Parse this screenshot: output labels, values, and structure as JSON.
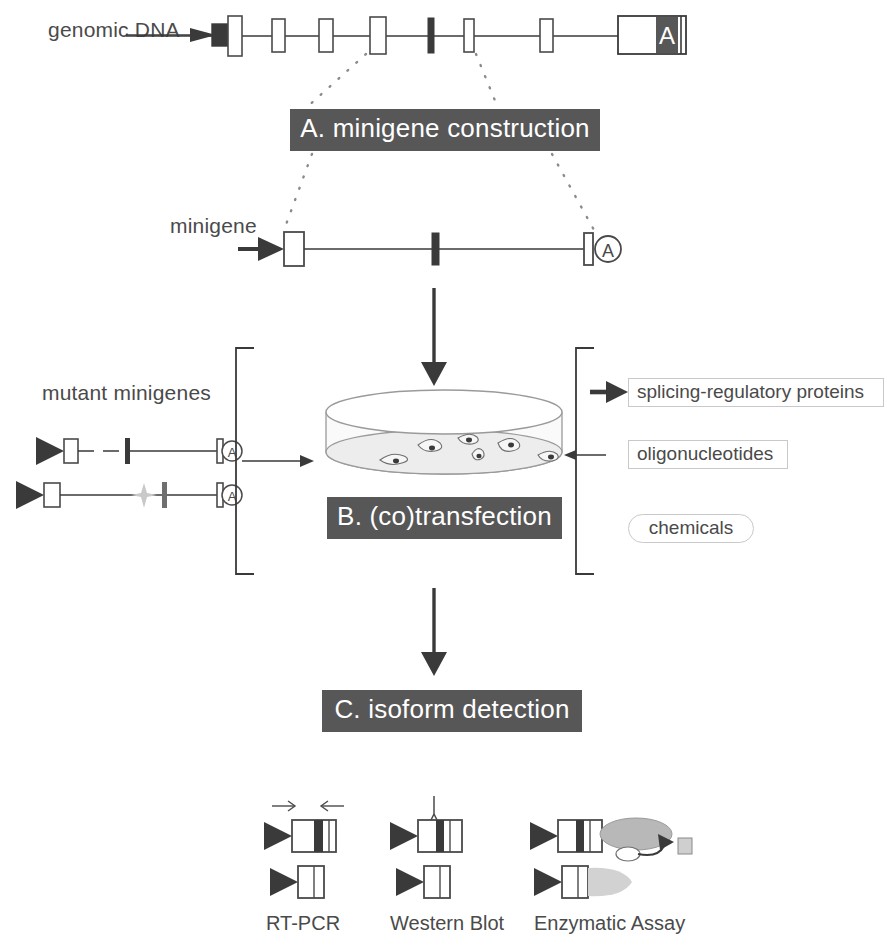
{
  "figure": {
    "title_rows": {
      "genomic_dna_label": "genomic DNA",
      "minigene_label": "minigene",
      "mutant_minigenes_label": "mutant minigenes"
    },
    "banners": [
      {
        "id": "a",
        "label": "A. minigene construction"
      },
      {
        "id": "b",
        "label": "B. (co)transfection"
      },
      {
        "id": "c",
        "label": "C. isoform detection"
      }
    ],
    "reagents": [
      {
        "label": "splicing-regulatory proteins",
        "shape": "rect",
        "has_arrow": true
      },
      {
        "label": "oligonucleotides",
        "shape": "rect",
        "has_arrow": false
      },
      {
        "label": "chemicals",
        "shape": "pill",
        "has_arrow": false
      }
    ],
    "detection_methods": [
      {
        "label": "RT-PCR",
        "icon": "primer-arrows-icon"
      },
      {
        "label": "Western Blot",
        "icon": "antibody-icon"
      },
      {
        "label": "Enzymatic Assay",
        "icon": "enzyme-substrate-icon"
      }
    ],
    "polyA_glyph": "A",
    "genomic_polyA_glyph": "A",
    "colors": {
      "banner_background": "#575757",
      "banner_text": "#ffffff",
      "line": "#3a3a3a",
      "exon_fill": "#ffffff",
      "cassette_exon_fill": "#3a3a3a",
      "enzyme_fill": "#b8b8b8",
      "dish_fill": "#f2f2f2",
      "text": "#4a4a4a",
      "reagent_border": "#c9c9c9"
    }
  }
}
